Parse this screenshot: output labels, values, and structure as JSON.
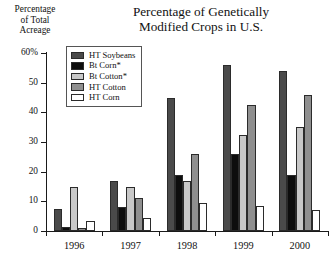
{
  "chart_data": {
    "type": "bar",
    "title": "Percentage of Genetically\nModified Crops in U.S.",
    "xlabel": "",
    "ylabel": "Percentage\nof Total\nAcreage",
    "categories": [
      "1996",
      "1997",
      "1998",
      "1999",
      "2000"
    ],
    "ylim": [
      0,
      60
    ],
    "ytick_labels": [
      "0",
      "10",
      "20",
      "30",
      "40",
      "50",
      "60%"
    ],
    "ytick_values": [
      0,
      10,
      20,
      30,
      40,
      50,
      60
    ],
    "grid": false,
    "legend_position": "upper-left-inside",
    "series": [
      {
        "name": "HT Soybeans",
        "color": "#4a4a4a",
        "values": [
          7.5,
          17,
          45,
          56,
          54
        ]
      },
      {
        "name": "Bt Corn*",
        "color": "#0d0d0d",
        "values": [
          1.5,
          8,
          19,
          26,
          19
        ]
      },
      {
        "name": "Bt Cotton*",
        "color": "#c8c8c8",
        "values": [
          15,
          15,
          17,
          32.5,
          35
        ]
      },
      {
        "name": "HT Cotton",
        "color": "#8f8f8f",
        "values": [
          1,
          11,
          26,
          42.5,
          46
        ]
      },
      {
        "name": "HT Corn",
        "color": "#ffffff",
        "values": [
          3.5,
          4.5,
          9.5,
          8.5,
          7
        ]
      }
    ]
  }
}
